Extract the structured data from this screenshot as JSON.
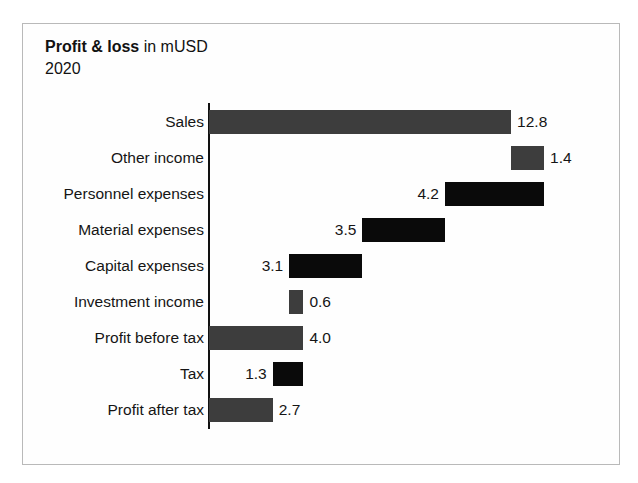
{
  "chart_frame": {
    "border_color": "#b9b9b9",
    "background": "#fefefe"
  },
  "header": {
    "title_strong": "Profit & loss",
    "title_rest": " in mUSD",
    "subtitle": "2020"
  },
  "colors": {
    "gray_bar": "#3d3d3d",
    "black_bar": "#0a0a0a",
    "axis": "#111111",
    "text": "#151515"
  },
  "chart_data": {
    "type": "bar",
    "chart_subtype": "waterfall",
    "title": "Profit & loss in mUSD",
    "subtitle": "2020",
    "xlabel": "",
    "ylabel": "",
    "units": "mUSD",
    "orientation": "horizontal",
    "grid": false,
    "legend": "none",
    "axis_origin_value": 0,
    "xlim": [
      0,
      14.2
    ],
    "categories": [
      "Sales",
      "Other income",
      "Personnel expenses",
      "Material expenses",
      "Capital expenses",
      "Investment income",
      "Profit before tax",
      "Tax",
      "Profit after tax"
    ],
    "values": [
      12.8,
      1.4,
      4.2,
      3.5,
      3.1,
      0.6,
      4.0,
      1.3,
      2.7
    ],
    "value_labels": [
      "12.8",
      "1.4",
      "4.2",
      "3.5",
      "3.1",
      "0.6",
      "4.0",
      "1.3",
      "2.7"
    ],
    "bars": [
      {
        "category": "Sales",
        "value": 12.8,
        "label": "12.8",
        "start": 0.0,
        "end": 12.8,
        "kind": "total",
        "color": "#3d3d3d",
        "label_side": "right"
      },
      {
        "category": "Other income",
        "value": 1.4,
        "label": "1.4",
        "start": 12.8,
        "end": 14.2,
        "kind": "increase",
        "color": "#3d3d3d",
        "label_side": "right"
      },
      {
        "category": "Personnel expenses",
        "value": 4.2,
        "label": "4.2",
        "start": 10.0,
        "end": 14.2,
        "kind": "decrease",
        "color": "#0a0a0a",
        "label_side": "left"
      },
      {
        "category": "Material expenses",
        "value": 3.5,
        "label": "3.5",
        "start": 6.5,
        "end": 10.0,
        "kind": "decrease",
        "color": "#0a0a0a",
        "label_side": "left"
      },
      {
        "category": "Capital expenses",
        "value": 3.1,
        "label": "3.1",
        "start": 3.4,
        "end": 6.5,
        "kind": "decrease",
        "color": "#0a0a0a",
        "label_side": "left"
      },
      {
        "category": "Investment income",
        "value": 0.6,
        "label": "0.6",
        "start": 3.4,
        "end": 4.0,
        "kind": "increase",
        "color": "#3d3d3d",
        "label_side": "right"
      },
      {
        "category": "Profit before tax",
        "value": 4.0,
        "label": "4.0",
        "start": 0.0,
        "end": 4.0,
        "kind": "total",
        "color": "#3d3d3d",
        "label_side": "right"
      },
      {
        "category": "Tax",
        "value": 1.3,
        "label": "1.3",
        "start": 2.7,
        "end": 4.0,
        "kind": "decrease",
        "color": "#0a0a0a",
        "label_side": "left"
      },
      {
        "category": "Profit after tax",
        "value": 2.7,
        "label": "2.7",
        "start": 0.0,
        "end": 2.7,
        "kind": "total",
        "color": "#3d3d3d",
        "label_side": "right"
      }
    ]
  },
  "geometry": {
    "axis_x": 208,
    "axis_top": 103,
    "axis_bottom": 429,
    "row_top": 104,
    "row_height": 36,
    "px_per_unit": 23.6,
    "label_right_edge": 204,
    "label_gap": 6
  }
}
